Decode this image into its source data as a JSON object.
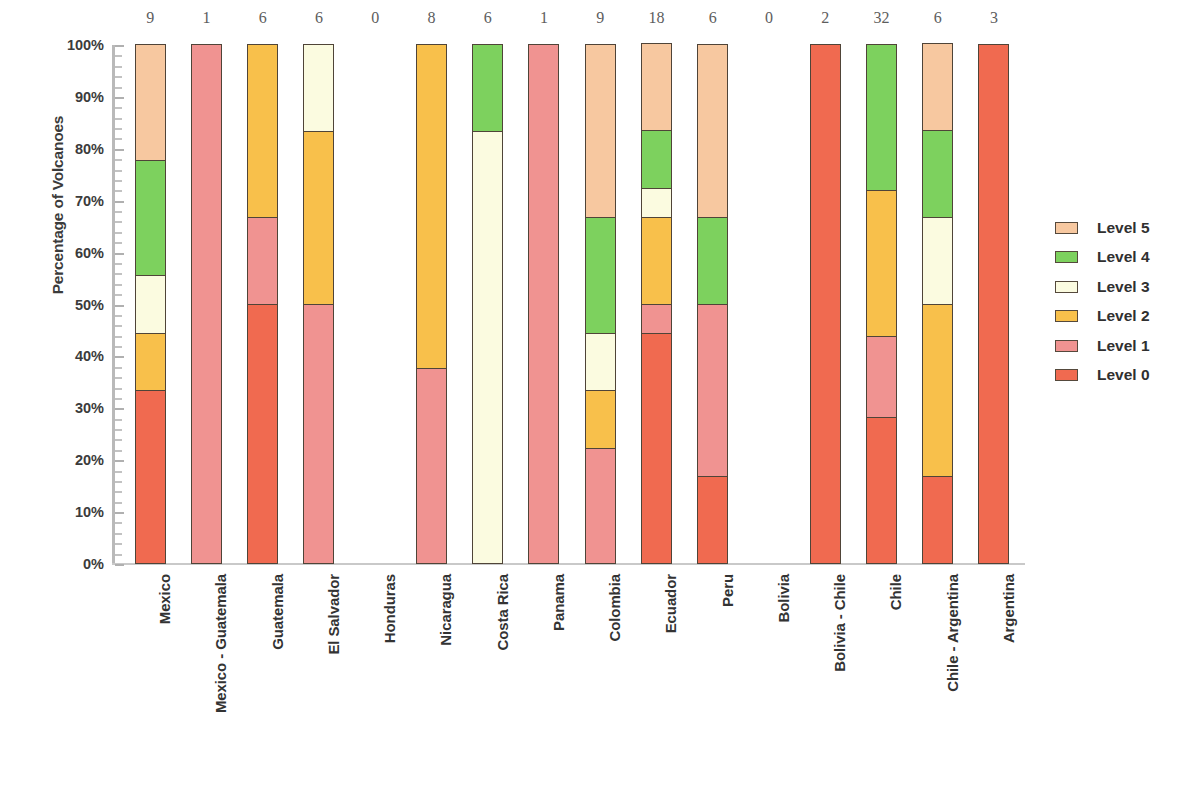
{
  "chart_data": {
    "type": "bar",
    "subtype": "stacked-percentage",
    "title": "",
    "xlabel": "",
    "ylabel": "Percentage of Volcanoes",
    "ylim": [
      0,
      100
    ],
    "grid": false,
    "legend_position": "right",
    "y_ticks": [
      "0%",
      "10%",
      "20%",
      "30%",
      "40%",
      "50%",
      "60%",
      "70%",
      "80%",
      "90%",
      "100%"
    ],
    "y_tick_values": [
      0,
      10,
      20,
      30,
      40,
      50,
      60,
      70,
      80,
      90,
      100
    ],
    "legend": [
      {
        "name": "Level 5",
        "color": "#F7C8A0"
      },
      {
        "name": "Level 4",
        "color": "#7DD15E"
      },
      {
        "name": "Level 3",
        "color": "#FBFBE0"
      },
      {
        "name": "Level 2",
        "color": "#F8C04B"
      },
      {
        "name": "Level 1",
        "color": "#F09391"
      },
      {
        "name": "Level 0",
        "color": "#F06A50"
      }
    ],
    "series": [
      {
        "name": "Level 0",
        "color": "#F06A50",
        "values": [
          33.3,
          0,
          50.0,
          0,
          0,
          0,
          0,
          0,
          0,
          44.4,
          16.7,
          0,
          100,
          28.1,
          16.7,
          100
        ]
      },
      {
        "name": "Level 1",
        "color": "#F09391",
        "values": [
          0,
          100,
          16.7,
          50.0,
          0,
          37.5,
          0,
          100,
          22.2,
          5.6,
          33.3,
          0,
          0,
          15.6,
          0,
          0
        ]
      },
      {
        "name": "Level 2",
        "color": "#F8C04B",
        "values": [
          11.1,
          0,
          33.3,
          33.3,
          0,
          62.5,
          0,
          0,
          11.1,
          16.7,
          0,
          0,
          0,
          28.1,
          33.3,
          0
        ]
      },
      {
        "name": "Level 3",
        "color": "#FBFBE0",
        "values": [
          11.1,
          0,
          0,
          16.7,
          0,
          0,
          83.3,
          0,
          11.1,
          5.6,
          0,
          0,
          0,
          0,
          16.7,
          0
        ]
      },
      {
        "name": "Level 4",
        "color": "#7DD15E",
        "values": [
          22.2,
          0,
          0,
          0,
          0,
          0,
          16.7,
          0,
          22.2,
          11.1,
          16.7,
          0,
          0,
          28.1,
          16.7,
          0
        ]
      },
      {
        "name": "Level 5",
        "color": "#F7C8A0",
        "values": [
          22.2,
          0,
          0,
          0,
          0,
          0,
          0,
          0,
          33.3,
          16.7,
          33.3,
          0,
          0,
          0,
          16.7,
          0
        ]
      }
    ],
    "categories": [
      "Mexico",
      "Mexico - Guatemala",
      "Guatemala",
      "El Salvador",
      "Honduras",
      "Nicaragua",
      "Costa Rica",
      "Panama",
      "Colombia",
      "Ecuador",
      "Peru",
      "Bolivia",
      "Bolivia - Chile",
      "Chile",
      "Chile - Argentina",
      "Argentina"
    ],
    "counts": [
      9,
      1,
      6,
      6,
      0,
      8,
      6,
      1,
      9,
      18,
      6,
      0,
      2,
      32,
      6,
      3
    ],
    "count_labels": [
      "9",
      "1",
      "6",
      "6",
      "0",
      "8",
      "6",
      "1",
      "9",
      "18",
      "6",
      "0",
      "2",
      "32",
      "6",
      "3"
    ]
  },
  "style": {
    "segment_border": "#4F4438",
    "axis_color": "#B9B9B9",
    "text_color": "#333333",
    "background": "#FFFFFF"
  }
}
